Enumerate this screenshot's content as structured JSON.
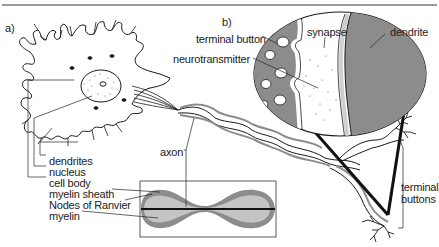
{
  "figure": {
    "panels": [
      {
        "id": "a",
        "label": "a)"
      },
      {
        "id": "b",
        "label": "b)"
      }
    ],
    "labels": {
      "dendrites": "dendrites",
      "nucleus": "nucleus",
      "cell_body": "cell body",
      "myelin_sheath": "myelin sheath",
      "nodes_of_ranvier": "Nodes of Ranvier",
      "myelin": "myelin",
      "axon": "axon",
      "terminal_button": "terminal button",
      "neurotransmitter": "neurotransmitter",
      "synapse": "synapse",
      "dendrite": "dendrite",
      "terminal_buttons_line1": "terminal",
      "terminal_buttons_line2": "buttons"
    },
    "colors": {
      "line": "#1a1a1a",
      "fill_dark": "#8c8c8c",
      "fill_light": "#c4c4c4",
      "rule": "#9a9a9a"
    }
  }
}
